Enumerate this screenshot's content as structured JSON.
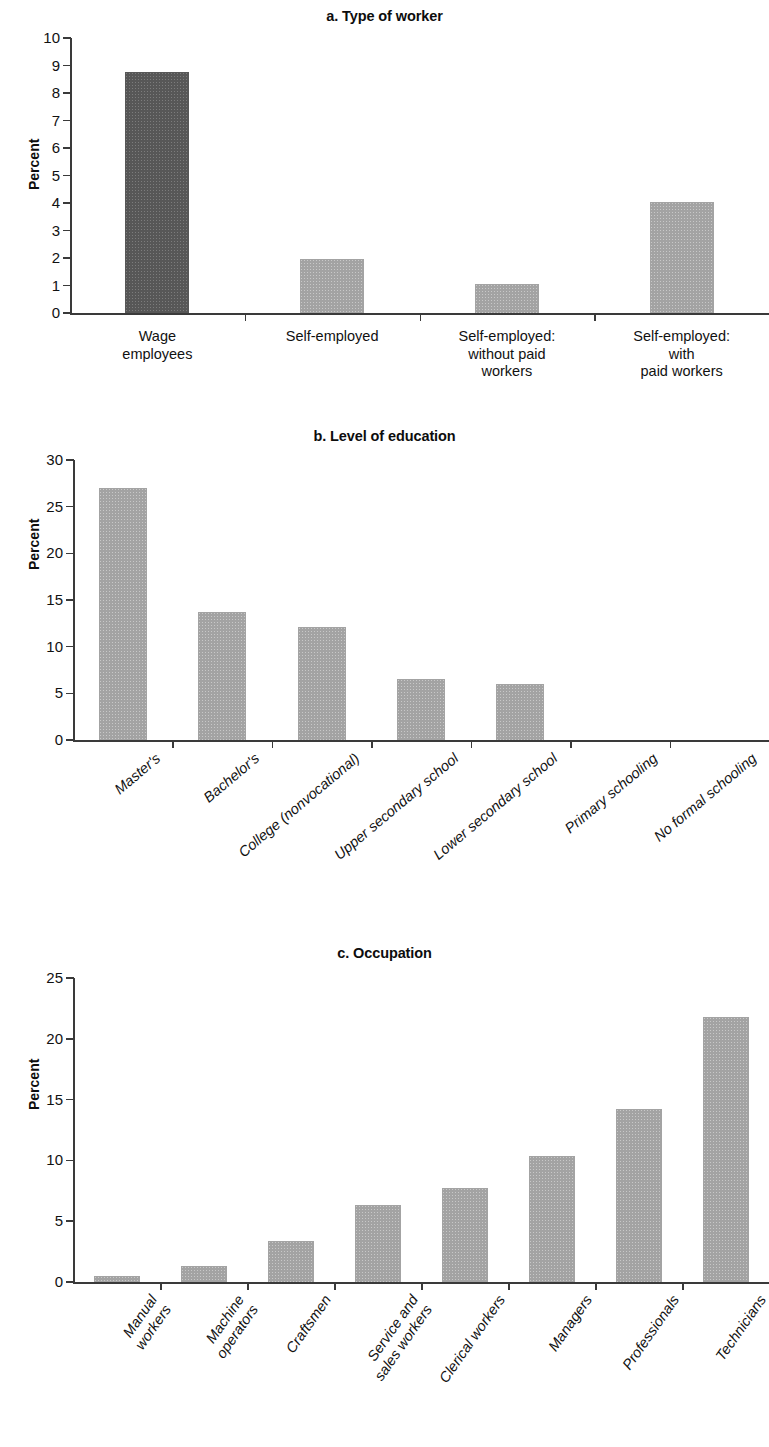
{
  "figure": {
    "ylabel": "Percent"
  },
  "chart_data": [
    {
      "type": "bar",
      "title": "a. Type of worker",
      "xlabel": "",
      "ylabel": "Percent",
      "ylim": [
        0,
        10
      ],
      "yticks": [
        "0",
        "1",
        "2",
        "3",
        "4",
        "5",
        "6",
        "7",
        "8",
        "9",
        "10"
      ],
      "grid": false,
      "legend": "none",
      "categories": [
        "Wage\nemployees",
        "Self-employed",
        "Self-employed:\nwithout paid\nworkers",
        "Self-employed:\nwith\npaid workers"
      ],
      "values": [
        8.75,
        1.95,
        1.05,
        4.05
      ],
      "bar_colors": [
        "#575757",
        "#a3a3a3",
        "#a3a3a3",
        "#a3a3a3"
      ]
    },
    {
      "type": "bar",
      "title": "b. Level of education",
      "xlabel": "",
      "ylabel": "Percent",
      "ylim": [
        0,
        30
      ],
      "yticks": [
        "0",
        "5",
        "10",
        "15",
        "20",
        "25",
        "30"
      ],
      "grid": false,
      "legend": "none",
      "categories": [
        "Master's",
        "Bachelor's",
        "College (nonvocational)",
        "Upper secondary school",
        "Lower secondary school",
        "Primary schooling",
        "No formal schooling"
      ],
      "values": [
        27.0,
        13.7,
        12.1,
        6.5,
        6.0,
        0,
        0
      ],
      "bar_colors": [
        "#a3a3a3",
        "#a3a3a3",
        "#a3a3a3",
        "#a3a3a3",
        "#a3a3a3",
        "#a3a3a3",
        "#a3a3a3"
      ]
    },
    {
      "type": "bar",
      "title": "c. Occupation",
      "xlabel": "",
      "ylabel": "Percent",
      "ylim": [
        0,
        25
      ],
      "yticks": [
        "0",
        "5",
        "10",
        "15",
        "20",
        "25"
      ],
      "grid": false,
      "legend": "none",
      "categories": [
        "Manual\nworkers",
        "Machine\noperators",
        "Craftsmen",
        "Service and\nsales workers",
        "Clerical workers",
        "Managers",
        "Professionals",
        "Technicians"
      ],
      "values": [
        0.5,
        1.3,
        3.4,
        6.3,
        7.7,
        10.4,
        14.2,
        21.8
      ],
      "bar_colors": [
        "#a3a3a3",
        "#a3a3a3",
        "#a3a3a3",
        "#a3a3a3",
        "#a3a3a3",
        "#a3a3a3",
        "#a3a3a3",
        "#a3a3a3"
      ]
    }
  ]
}
